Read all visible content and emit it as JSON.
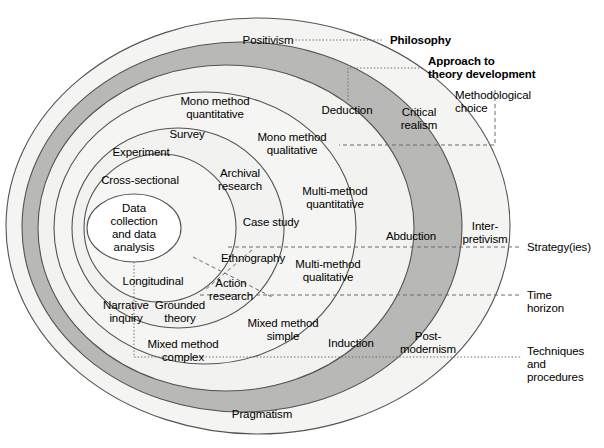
{
  "diagram": {
    "type": "concentric-layers",
    "center": {
      "x": 133,
      "y": 228
    },
    "colors": {
      "ring_light": "#f1f1ef",
      "ring_lighter": "#f6f6f4",
      "ring_dark": "#b9b9b7",
      "ring_white": "#ffffff",
      "stroke": "#4a4a4a",
      "text": "#000000"
    },
    "layers": [
      {
        "name": "philosophy",
        "callout": "Philosophy",
        "items": [
          "Positivism",
          "Critical realism",
          "Interpretivism",
          "Postmodernism",
          "Pragmatism"
        ]
      },
      {
        "name": "approach-to-theory-development",
        "callout": "Approach to theory development",
        "items": [
          "Deduction",
          "Abduction",
          "Induction"
        ]
      },
      {
        "name": "methodological-choice",
        "callout": "Methodological choice",
        "items": [
          "Mono method quantitative",
          "Mono method qualitative",
          "Multi-method quantitative",
          "Multi-method qualitative",
          "Mixed method simple",
          "Mixed method complex"
        ]
      },
      {
        "name": "strategies",
        "callout": "Strategy(ies)",
        "items": [
          "Experiment",
          "Survey",
          "Archival research",
          "Case study",
          "Ethnography",
          "Action research",
          "Grounded theory",
          "Narrative inquiry"
        ]
      },
      {
        "name": "time-horizon",
        "callout": "Time horizon",
        "items": [
          "Cross-sectional",
          "Longitudinal"
        ]
      },
      {
        "name": "techniques-and-procedures",
        "callout": "Techniques and procedures",
        "items": [
          "Data collection and data analysis"
        ]
      }
    ]
  },
  "callouts": {
    "philosophy": "Philosophy",
    "approach": "Approach to\ntheory development",
    "methodological_choice": "Methodological\nchoice",
    "strategies": "Strategy(ies)",
    "time_horizon": "Time\nhorizon",
    "techniques": "Techniques and\nprocedures"
  },
  "labels": {
    "positivism": "Positivism",
    "critical_realism": "Critical\nrealism",
    "interpretivism": "Inter-\npretivism",
    "postmodernism": "Post-\nmodernism",
    "pragmatism": "Pragmatism",
    "deduction": "Deduction",
    "abduction": "Abduction",
    "induction": "Induction",
    "mono_method_quantitative": "Mono method\nquantitative",
    "mono_method_qualitative": "Mono method\nqualitative",
    "multi_method_quantitative": "Multi-method\nquantitative",
    "multi_method_qualitative": "Multi-method\nqualitative",
    "mixed_method_simple": "Mixed method\nsimple",
    "mixed_method_complex": "Mixed method\ncomplex",
    "experiment": "Experiment",
    "survey": "Survey",
    "archival_research": "Archival\nresearch",
    "case_study": "Case study",
    "ethnography": "Ethnography",
    "action_research": "Action\nresearch",
    "grounded_theory": "Grounded\ntheory",
    "narrative_inquiry": "Narrative\ninquiry",
    "cross_sectional": "Cross-sectional",
    "longitudinal": "Longitudinal",
    "data_collection": "Data\ncollection\nand data\nanalysis"
  }
}
